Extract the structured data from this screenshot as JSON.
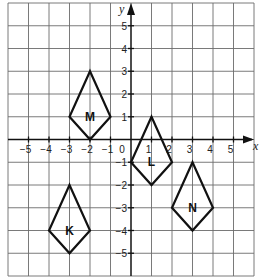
{
  "diagram": {
    "type": "coordinate-grid",
    "x_axis": {
      "label": "x",
      "range": [
        -6,
        6
      ],
      "tick_labels": [
        "-5",
        "-4",
        "-3",
        "-2",
        "-1",
        "0",
        "1",
        "2",
        "3",
        "4",
        "5"
      ]
    },
    "y_axis": {
      "label": "y",
      "range": [
        -6,
        6
      ],
      "tick_labels": [
        "5",
        "4",
        "3",
        "2",
        "1",
        "-1",
        "-2",
        "-3",
        "-4",
        "-5"
      ]
    },
    "shapes": [
      {
        "label": "M",
        "vertices": [
          [
            -2,
            3
          ],
          [
            -1,
            1
          ],
          [
            -2,
            0
          ],
          [
            -3,
            1
          ]
        ]
      },
      {
        "label": "L",
        "vertices": [
          [
            1,
            1
          ],
          [
            2,
            -1
          ],
          [
            1,
            -2
          ],
          [
            0,
            -1
          ]
        ]
      },
      {
        "label": "N",
        "vertices": [
          [
            3,
            -1
          ],
          [
            4,
            -3
          ],
          [
            3,
            -4
          ],
          [
            2,
            -3
          ]
        ]
      },
      {
        "label": "K",
        "vertices": [
          [
            -3,
            -2
          ],
          [
            -2,
            -4
          ],
          [
            -3,
            -5
          ],
          [
            -4,
            -4
          ]
        ]
      }
    ],
    "colors": {
      "grid": "#6b6b6b",
      "axis": "#111111",
      "shape": "#111111"
    }
  }
}
